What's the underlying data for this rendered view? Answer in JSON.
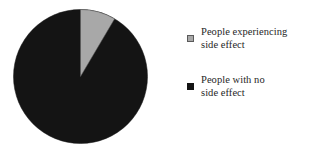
{
  "figure": {
    "background_color": "#ffffff"
  },
  "chart_data": {
    "type": "pie",
    "title": "",
    "subtitle": "",
    "xlabel": "",
    "ylabel": "",
    "grid": false,
    "legend_position": "right",
    "start_angle_deg": 0,
    "direction": "clockwise",
    "categories": [
      "People experiencing side effect",
      "People with no side effect"
    ],
    "values": [
      8.5,
      91.5
    ],
    "units": "percent",
    "colors": [
      "#a8a8a8",
      "#141414"
    ],
    "slices": [
      {
        "label": "People experiencing side effect",
        "value": 8.5,
        "start_angle_deg": 0,
        "end_angle_deg": 30.6,
        "color": "#a8a8a8",
        "edge_color": "#5a5a5a"
      },
      {
        "label": "People with no side effect",
        "value": 91.5,
        "start_angle_deg": 30.6,
        "end_angle_deg": 360,
        "color": "#141414",
        "edge_color": "#141414"
      }
    ],
    "annotations": []
  },
  "legend": {
    "entries": [
      {
        "label": "People experiencing\nside effect",
        "swatch_color": "#a8a8a8",
        "swatch_icon": "legend-square-gray-icon"
      },
      {
        "label": "People with no\nside effect",
        "swatch_color": "#141414",
        "swatch_icon": "legend-square-black-icon"
      }
    ]
  }
}
